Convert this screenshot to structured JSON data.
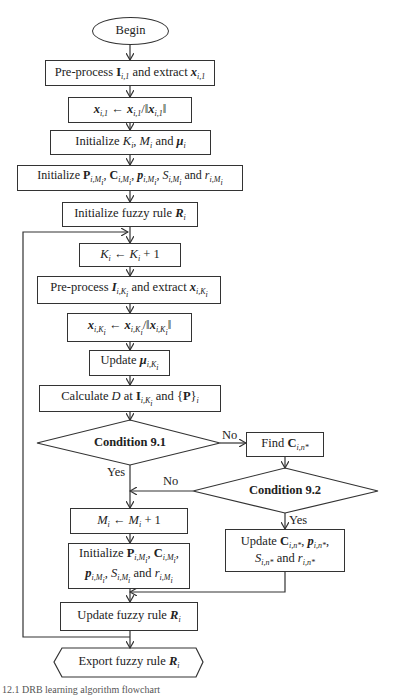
{
  "diagram": {
    "type": "flowchart",
    "nodes": {
      "begin": "Begin",
      "preprocess1": "Pre-process I_i,1 and extract x_i,1",
      "normalize1": "x_i,1 ← x_i,1 / ||x_i,1||",
      "init_kmu": "Initialize K_i, M_i and μ_i",
      "init_params": "Initialize P_i,M_i, C_i,M_i, p_i,M_i, S_i,M_i and r_i,M_i",
      "init_rule": "Initialize fuzzy rule R_i",
      "inc_k": "K_i ← K_i + 1",
      "preprocess_k": "Pre-process I_i,K_i and extract x_i,K_i",
      "normalize_k": "x_i,K_i ← x_i,K_i / ||x_i,K_i||",
      "update_mu": "Update μ_i,K_i",
      "calc_d": "Calculate D at I_i,K_i and {P}_i",
      "cond91": "Condition 9.1",
      "find_c": "Find C_i,n*",
      "cond92": "Condition 9.2",
      "inc_m": "M_i ← M_i + 1",
      "init_new": "Initialize P_i,M_i, C_i,M_i, p_i,M_i, S_i,M_i and r_i,M_i",
      "update_c": "Update C_i,n*, p_i,n*, S_i,n* and r_i,n*",
      "update_rule": "Update fuzzy rule R_i",
      "export_rule": "Export fuzzy rule R_i"
    },
    "edge_labels": {
      "cond91_no": "No",
      "cond91_yes": "Yes",
      "cond92_no": "No",
      "cond92_yes": "Yes"
    },
    "parts": {
      "begin": "Begin",
      "preprocess": "Pre-process",
      "and_extract": "and extract",
      "initialize": "Initialize",
      "and": "and",
      "fuzzy_rule": "fuzzy rule",
      "update": "Update",
      "calculate": "Calculate",
      "at": "at",
      "find": "Find",
      "export": "Export",
      "plus_one": "+ 1"
    },
    "caption": "12.1  DRB learning algorithm flowchart"
  }
}
